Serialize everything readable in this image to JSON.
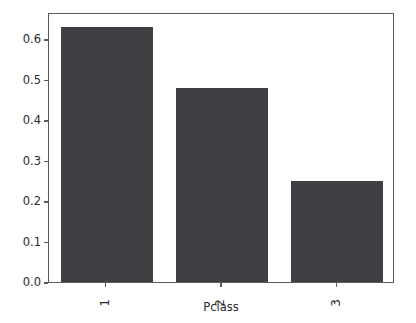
{
  "chart_data": {
    "type": "bar",
    "title": "",
    "subtitle": "",
    "xlabel": "Pclass",
    "ylabel": "",
    "categories": [
      "1",
      "2",
      "3"
    ],
    "values": [
      0.63,
      0.48,
      0.25
    ],
    "series": [
      {
        "name": "",
        "values": [
          0.63,
          0.48,
          0.25
        ]
      }
    ],
    "ylim": [
      0.0,
      0.6667
    ],
    "xlim": [
      -0.5,
      2.5
    ],
    "yticks": [
      "0.0",
      "0.1",
      "0.2",
      "0.3",
      "0.4",
      "0.5",
      "0.6"
    ],
    "ytick_values": [
      0.0,
      0.1,
      0.2,
      0.3,
      0.4,
      0.5,
      0.6
    ],
    "xticks": [
      "1",
      "2",
      "3"
    ],
    "xtick_rotation_degrees": 90,
    "grid": false,
    "legend": false,
    "legend_position": "none",
    "bar_color": "#404044",
    "axis_color": "#5b5b5b",
    "text_color": "#2b2b2b",
    "background_color": "#ffffff",
    "bar_width_fraction": 0.8
  }
}
